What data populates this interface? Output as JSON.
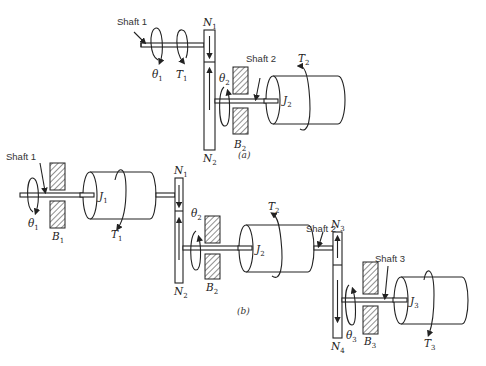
{
  "diagram": {
    "part_a": {
      "caption": "(a)",
      "labels": {
        "shaft1": "Shaft 1",
        "shaft2": "Shaft 2",
        "theta1": "θ",
        "theta1_sub": "1",
        "T1": "T",
        "T1_sub": "1",
        "N1": "N",
        "N1_sub": "1",
        "N2": "N",
        "N2_sub": "2",
        "theta2": "θ",
        "theta2_sub": "2",
        "B2": "B",
        "B2_sub": "2",
        "J2": "J",
        "J2_sub": "2",
        "T2": "T",
        "T2_sub": "2"
      }
    },
    "part_b": {
      "caption": "(b)",
      "labels": {
        "shaft1": "Shaft 1",
        "shaft2": "Shaft 2",
        "shaft3": "Shaft 3",
        "theta1": "θ",
        "theta1_sub": "1",
        "B1": "B",
        "B1_sub": "1",
        "J1": "J",
        "J1_sub": "1",
        "T1": "T",
        "T1_sub": "1",
        "N1": "N",
        "N1_sub": "1",
        "N2": "N",
        "N2_sub": "2",
        "theta2": "θ",
        "theta2_sub": "2",
        "B2": "B",
        "B2_sub": "2",
        "J2": "J",
        "J2_sub": "2",
        "T2": "T",
        "T2_sub": "2",
        "N3": "N",
        "N3_sub": "3",
        "N4": "N",
        "N4_sub": "4",
        "theta3": "θ",
        "theta3_sub": "3",
        "B3": "B",
        "B3_sub": "3",
        "J3": "J",
        "J3_sub": "3",
        "T3": "T",
        "T3_sub": "3"
      }
    }
  }
}
